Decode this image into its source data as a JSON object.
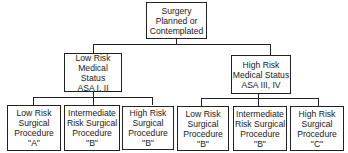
{
  "diagram": {
    "root": {
      "label": "Surgery\nPlanned or\nContemplated"
    },
    "level2": [
      {
        "label": "Low Risk\nMedical Status\nASA I, II"
      },
      {
        "label": "High Risk\nMedical Status\nASA III, IV"
      }
    ],
    "level3": [
      {
        "label": "Low Risk\nSurgical\nProcedure\n\"A\""
      },
      {
        "label": "Intermediate\nRisk Surgical\nProcedure\n\"B\""
      },
      {
        "label": "High Risk\nSurgical\nProcedure\n\"B\""
      },
      {
        "label": "Low Risk\nSurgical\nProcedure\n\"B\""
      },
      {
        "label": "Intermediate\nRisk Surgical\nProcedure\n\"B\""
      },
      {
        "label": "High Risk\nSurgical\nProcedure\n\"C\""
      }
    ]
  }
}
